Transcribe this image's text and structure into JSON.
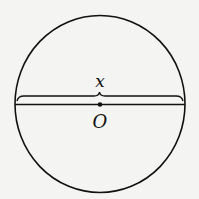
{
  "diagram": {
    "center_label": "O",
    "diameter_label": "x",
    "colors": {
      "stroke": "#111111",
      "background": "#f4f4f2"
    }
  }
}
